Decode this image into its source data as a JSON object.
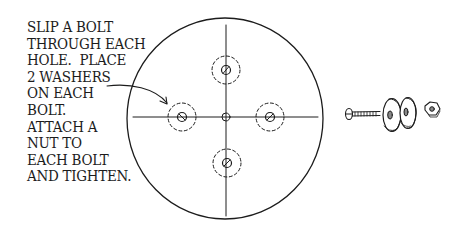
{
  "diagram": {
    "type": "assembly-instruction-illustration",
    "instructions": {
      "lines": [
        "SLIP A BOLT",
        "THROUGH EACH",
        "HOLE.  PLACE",
        "2 WASHERS",
        "ON EACH",
        "BOLT.",
        "ATTACH A",
        "NUT TO",
        "EACH BOLT",
        "AND TIGHTEN."
      ]
    },
    "disc": {
      "shape": "circle",
      "holes": [
        {
          "position": "top",
          "has_bolt": true
        },
        {
          "position": "left",
          "has_bolt": true
        },
        {
          "position": "right",
          "has_bolt": true
        },
        {
          "position": "bottom",
          "has_bolt": true
        },
        {
          "position": "center",
          "has_bolt": false
        }
      ],
      "washer_outline": "dashed",
      "crosshair": true
    },
    "callout_arrow": {
      "from": "instructions",
      "to": "left-hole"
    },
    "hardware_exploded_view": [
      "bolt",
      "washer",
      "washer",
      "nut"
    ],
    "colors": {
      "ink": "#1c1c1c",
      "background": "#ffffff"
    }
  }
}
